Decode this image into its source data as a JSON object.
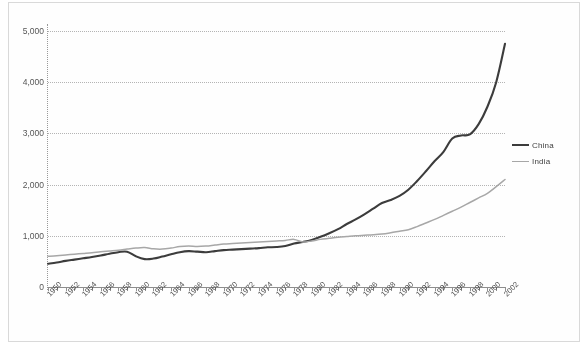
{
  "chart_data": {
    "type": "line",
    "title": "",
    "subtitle": "",
    "xlabel": "",
    "ylabel": "",
    "ylim": [
      0,
      5000
    ],
    "xlim": [
      1950,
      2002
    ],
    "grid": true,
    "y_ticks": [
      "0",
      "1,000",
      "2,000",
      "3,000",
      "4,000",
      "5,000"
    ],
    "y_tick_values": [
      0,
      1000,
      2000,
      3000,
      4000,
      5000
    ],
    "legend_position": "right",
    "legend": [
      "China",
      "India"
    ],
    "x_tick_labels": [
      "1950",
      "1952",
      "1954",
      "1956",
      "1958",
      "1960",
      "1962",
      "1964",
      "1966",
      "1968",
      "1970",
      "1972",
      "1974",
      "1976",
      "1978",
      "1980",
      "1982",
      "1984",
      "1986",
      "1988",
      "1990",
      "1992",
      "1994",
      "1996",
      "1998",
      "2000",
      "2002"
    ],
    "x": [
      1950,
      1951,
      1952,
      1953,
      1954,
      1955,
      1956,
      1957,
      1958,
      1959,
      1960,
      1961,
      1962,
      1963,
      1964,
      1965,
      1966,
      1967,
      1968,
      1969,
      1970,
      1971,
      1972,
      1973,
      1974,
      1975,
      1976,
      1977,
      1978,
      1979,
      1980,
      1981,
      1982,
      1983,
      1984,
      1985,
      1986,
      1987,
      1988,
      1989,
      1990,
      1991,
      1992,
      1993,
      1994,
      1995,
      1996,
      1997,
      1998,
      1999,
      2000,
      2001,
      2002
    ],
    "series": [
      {
        "name": "China",
        "color": "#3a3a3a",
        "values": [
          455,
          480,
          510,
          535,
          560,
          585,
          615,
          650,
          680,
          690,
          600,
          545,
          555,
          595,
          640,
          680,
          700,
          690,
          680,
          700,
          720,
          730,
          740,
          750,
          760,
          775,
          780,
          800,
          850,
          880,
          920,
          980,
          1050,
          1130,
          1230,
          1320,
          1420,
          1530,
          1640,
          1700,
          1780,
          1900,
          2070,
          2260,
          2460,
          2640,
          2900,
          2960,
          2980,
          3180,
          3520,
          4000,
          4750
        ]
      },
      {
        "name": "India",
        "color": "#a8a8a8",
        "values": [
          600,
          610,
          625,
          640,
          655,
          670,
          690,
          705,
          720,
          740,
          760,
          770,
          745,
          740,
          760,
          790,
          800,
          790,
          800,
          820,
          840,
          850,
          860,
          870,
          880,
          890,
          900,
          910,
          930,
          880,
          900,
          930,
          950,
          970,
          985,
          1000,
          1010,
          1020,
          1035,
          1060,
          1090,
          1120,
          1180,
          1250,
          1320,
          1400,
          1480,
          1560,
          1650,
          1740,
          1830,
          1960,
          2100
        ]
      }
    ]
  },
  "chart_meta": {
    "background_color": "#fefefe",
    "gridline_color": "#b6b6b6",
    "axis_color": "#8d8d8d",
    "frame_color": "#d9d9d9"
  }
}
